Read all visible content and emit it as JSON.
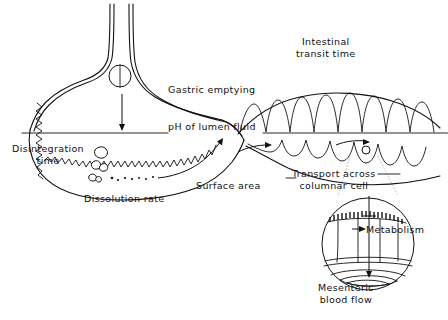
{
  "figure": {
    "background_color": "#ffffff",
    "ink_color": "#111111",
    "width": 448,
    "height": 320
  },
  "labels": {
    "intestinal_transit_time_line1": "Intestinal",
    "intestinal_transit_time_line2": "transit time",
    "gastric_emptying": "Gastric emptying",
    "ph_of_lumen_fluid": "pH of lumen fluid",
    "disintegration_line1": "Disintegration",
    "disintegration_line2": "time",
    "dissolution_rate": "Dissolution rate",
    "surface_area": "Surface area",
    "transport_across_line1": "Transport across",
    "transport_across_line2": "columnar cell",
    "metabolism": "Metabolism",
    "mesenteric_line1": "Mesenteric",
    "mesenteric_line2": "blood flow"
  },
  "anatomy": {
    "esophagus": "esophagus-tube",
    "stomach": "stomach-body",
    "stomach_rugae": "stomach-rugae-zigzag",
    "pylorus": "pyloric-junction",
    "upper_intestine": "upper-intestinal-villi",
    "lower_intestine": "lower-intestinal-villi",
    "lumen_divider": "lumen-fluid-divider-line",
    "inset_circle": "columnar-cell-inset",
    "inset_brush_border": "brush-border-microvilli",
    "inset_blood_vessel": "mesenteric-blood-vessel"
  },
  "objects": {
    "tablet": "tablet-dosage-form",
    "tablet_fall_arrow": "downward-fall-arrow",
    "granules": "disintegrated-granules",
    "dissolved_particles": "dissolved-drug-dots",
    "gastric_emptying_arrow": "curved-emptying-arrow",
    "transit_arrow_left": "intestinal-transit-arrow-left",
    "transit_arrow_right": "intestinal-transit-arrow-right",
    "absorption_particle": "absorbed-drug-particle",
    "metabolism_arrow": "metabolism-arrow",
    "transport_arrow": "transcellular-transport-arrow"
  }
}
